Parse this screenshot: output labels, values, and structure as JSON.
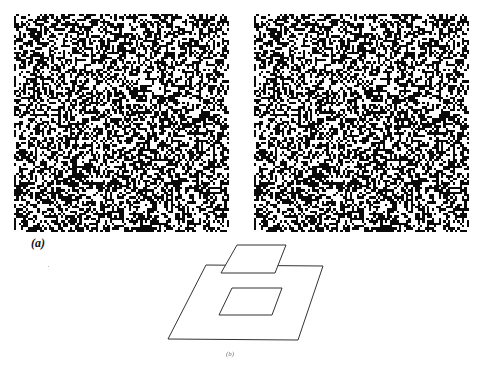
{
  "figure": {
    "panel_a": {
      "label": "(a)",
      "description": "Random-dot stereogram pair",
      "left_image": {
        "name": "left-random-dot-image",
        "grid": 92,
        "density": 0.5
      },
      "right_image": {
        "name": "right-random-dot-image",
        "grid": 92,
        "density": 0.5,
        "shifted_region": "central square shifted horizontally"
      }
    },
    "panel_b": {
      "label": "(b)",
      "description": "Perceived depth planes: background surface with central square floating above",
      "shapes": [
        {
          "name": "background-plane",
          "points": [
            [
              206,
              265
            ],
            [
              323,
              266
            ],
            [
              298,
              340
            ],
            [
              168,
              339
            ]
          ]
        },
        {
          "name": "floating-square",
          "points": [
            [
              237,
              245
            ],
            [
              286,
              245
            ],
            [
              275,
              273
            ],
            [
              221,
              273
            ]
          ]
        },
        {
          "name": "hole-outline",
          "points": [
            [
              232,
              288
            ],
            [
              282,
              288
            ],
            [
              272,
              315
            ],
            [
              219,
              315
            ]
          ]
        }
      ],
      "stroke_color": "#333333"
    }
  }
}
